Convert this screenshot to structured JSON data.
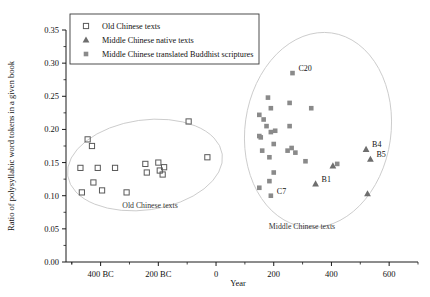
{
  "chart_data": {
    "type": "scatter",
    "title": "",
    "xlabel": "Year",
    "ylabel": "Ratio of polysyllabic word tokens in a given book",
    "xlim": [
      -520,
      700
    ],
    "ylim": [
      0.0,
      0.35
    ],
    "grid": false,
    "legend_position": "top-left",
    "xticks": [
      {
        "value": -400,
        "label": "400 BC"
      },
      {
        "value": -200,
        "label": "200 BC"
      },
      {
        "value": 0,
        "label": "0"
      },
      {
        "value": 200,
        "label": "200"
      },
      {
        "value": 400,
        "label": "400"
      },
      {
        "value": 600,
        "label": "600"
      }
    ],
    "yticks": [
      "0.00",
      "0.05",
      "0.10",
      "0.15",
      "0.20",
      "0.25",
      "0.30",
      "0.35"
    ],
    "minor_ticks": true,
    "series": [
      {
        "name": "Old Chinese texts",
        "marker": "open-square",
        "color": "#595959",
        "points": [
          {
            "x": -465,
            "y": 0.105
          },
          {
            "x": -470,
            "y": 0.142
          },
          {
            "x": -445,
            "y": 0.185
          },
          {
            "x": -430,
            "y": 0.175
          },
          {
            "x": -425,
            "y": 0.12
          },
          {
            "x": -410,
            "y": 0.142
          },
          {
            "x": -395,
            "y": 0.108
          },
          {
            "x": -350,
            "y": 0.142
          },
          {
            "x": -310,
            "y": 0.105
          },
          {
            "x": -245,
            "y": 0.148
          },
          {
            "x": -240,
            "y": 0.135
          },
          {
            "x": -200,
            "y": 0.15
          },
          {
            "x": -195,
            "y": 0.138
          },
          {
            "x": -185,
            "y": 0.132
          },
          {
            "x": -180,
            "y": 0.143
          },
          {
            "x": -95,
            "y": 0.212
          },
          {
            "x": -30,
            "y": 0.158
          }
        ]
      },
      {
        "name": "Middle Chinese native texts",
        "marker": "filled-triangle",
        "color": "#6e6e6e",
        "points": [
          {
            "x": 345,
            "y": 0.118,
            "label": "B1"
          },
          {
            "x": 405,
            "y": 0.145
          },
          {
            "x": 520,
            "y": 0.17,
            "label": "B4"
          },
          {
            "x": 535,
            "y": 0.155,
            "label": "B5"
          },
          {
            "x": 525,
            "y": 0.103
          }
        ]
      },
      {
        "name": "Middle Chinese translated Buddhist scriptures",
        "marker": "filled-square",
        "color": "#8a8a8a",
        "points": [
          {
            "x": 150,
            "y": 0.222
          },
          {
            "x": 165,
            "y": 0.215
          },
          {
            "x": 180,
            "y": 0.248
          },
          {
            "x": 190,
            "y": 0.232
          },
          {
            "x": 150,
            "y": 0.19
          },
          {
            "x": 155,
            "y": 0.188
          },
          {
            "x": 175,
            "y": 0.205
          },
          {
            "x": 190,
            "y": 0.196
          },
          {
            "x": 205,
            "y": 0.198
          },
          {
            "x": 160,
            "y": 0.168
          },
          {
            "x": 185,
            "y": 0.158
          },
          {
            "x": 200,
            "y": 0.178
          },
          {
            "x": 265,
            "y": 0.285,
            "label": "C20"
          },
          {
            "x": 255,
            "y": 0.24
          },
          {
            "x": 255,
            "y": 0.205
          },
          {
            "x": 248,
            "y": 0.168
          },
          {
            "x": 262,
            "y": 0.172
          },
          {
            "x": 275,
            "y": 0.165
          },
          {
            "x": 310,
            "y": 0.152
          },
          {
            "x": 330,
            "y": 0.232
          },
          {
            "x": 200,
            "y": 0.135
          },
          {
            "x": 185,
            "y": 0.122
          },
          {
            "x": 150,
            "y": 0.112
          },
          {
            "x": 190,
            "y": 0.1,
            "label": "C7"
          },
          {
            "x": 420,
            "y": 0.148
          }
        ]
      }
    ],
    "annotations": [
      {
        "text": "Old Chinese texts",
        "x": 150,
        "y": 208
      },
      {
        "text": "Middle Chinese texts",
        "x": 302,
        "y": 229
      }
    ],
    "ellipses": [
      {
        "cx": 145,
        "cy": 165,
        "rx": 78,
        "ry": 45,
        "rotate": -8
      },
      {
        "cx": 318,
        "cy": 130,
        "rx": 73,
        "ry": 98,
        "rotate": 8
      }
    ]
  },
  "legend": {
    "items": [
      {
        "label": "Old Chinese texts",
        "marker": "open-square"
      },
      {
        "label": "Middle Chinese native texts",
        "marker": "filled-triangle"
      },
      {
        "label": "Middle Chinese translated Buddhist scriptures",
        "marker": "filled-square"
      }
    ]
  }
}
